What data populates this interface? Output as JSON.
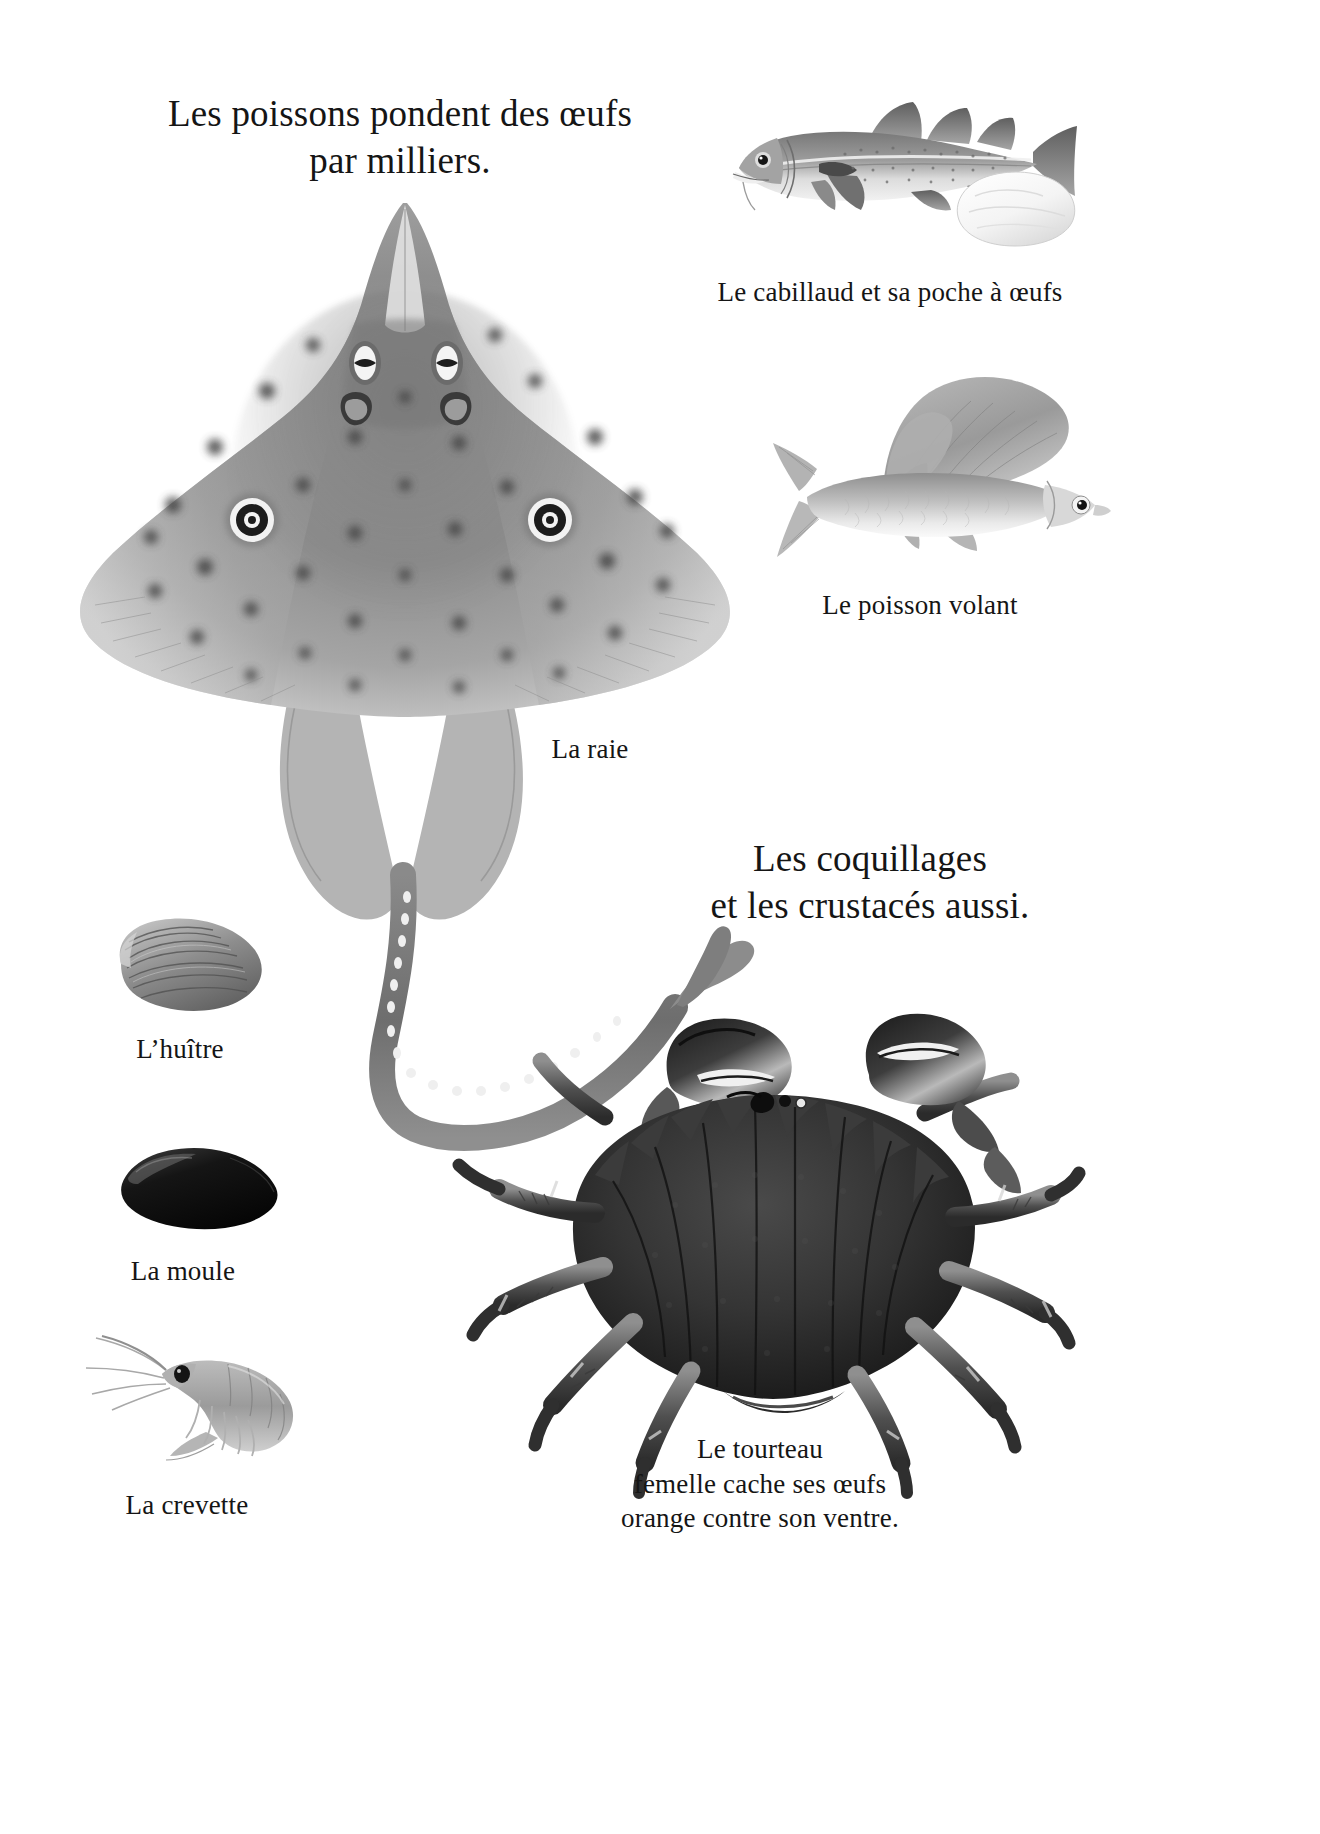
{
  "page": {
    "background_color": "#ffffff",
    "ink_color": "#151515",
    "language": "fr"
  },
  "headings": [
    {
      "id": "fish-heading",
      "text": "Les poissons pondent des œufs\npar milliers.",
      "x": 165,
      "y": 90,
      "width": 470
    },
    {
      "id": "shellfish-heading",
      "text": "Les coquillages\net les crustacés aussi.",
      "x": 705,
      "y": 835,
      "width": 330
    }
  ],
  "captions": [
    {
      "id": "cod-caption",
      "text": "Le cabillaud et sa poche à œufs",
      "x": 690,
      "y": 275,
      "width": 400
    },
    {
      "id": "flyingfish-caption",
      "text": "Le poisson volant",
      "x": 790,
      "y": 588,
      "width": 260
    },
    {
      "id": "ray-caption",
      "text": "La raie",
      "x": 515,
      "y": 732,
      "width": 150
    },
    {
      "id": "oyster-caption",
      "text": "L’huître",
      "x": 100,
      "y": 1032,
      "width": 160
    },
    {
      "id": "mussel-caption",
      "text": "La moule",
      "x": 98,
      "y": 1254,
      "width": 170
    },
    {
      "id": "shrimp-caption",
      "text": "La crevette",
      "x": 92,
      "y": 1488,
      "width": 190
    },
    {
      "id": "crab-caption",
      "text": "Le tourteau\nfemelle cache ses œufs\norange contre son ventre.",
      "x": 595,
      "y": 1432,
      "width": 330
    }
  ],
  "illustrations": [
    {
      "id": "ray",
      "name": "ray-illustration",
      "label": "La raie",
      "x": 55,
      "y": 185,
      "width": 700,
      "height": 760
    },
    {
      "id": "cod",
      "name": "cod-illustration",
      "label": "Le cabillaud et sa poche à œufs",
      "x": 715,
      "y": 80,
      "width": 360,
      "height": 180
    },
    {
      "id": "egg-sac",
      "name": "egg-sac-illustration",
      "label": "poche à œufs",
      "x": 945,
      "y": 165,
      "width": 135,
      "height": 85
    },
    {
      "id": "flyingfish",
      "name": "flying-fish-illustration",
      "label": "Le poisson volant",
      "x": 765,
      "y": 365,
      "width": 345,
      "height": 205
    },
    {
      "id": "oyster",
      "name": "oyster-illustration",
      "label": "L’huître",
      "x": 105,
      "y": 915,
      "width": 165,
      "height": 105
    },
    {
      "id": "mussel",
      "name": "mussel-illustration",
      "label": "La moule",
      "x": 112,
      "y": 1140,
      "width": 175,
      "height": 100
    },
    {
      "id": "shrimp",
      "name": "shrimp-illustration",
      "label": "La crevette",
      "x": 80,
      "y": 1330,
      "width": 230,
      "height": 130
    },
    {
      "id": "crab",
      "name": "crab-illustration",
      "label": "Le tourteau",
      "x": 455,
      "y": 1010,
      "width": 620,
      "height": 460
    }
  ]
}
